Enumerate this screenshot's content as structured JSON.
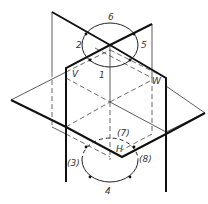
{
  "diagram": {
    "type": "three intersecting planes with rotation circles",
    "planes": {
      "V": "V",
      "W": "W",
      "H": "H"
    },
    "top_circle_labels": {
      "l1": "1",
      "l2": "2",
      "l5": "5",
      "l6": "6"
    },
    "bottom_circle_labels": {
      "l3": "(3)",
      "l4": "4",
      "l7": "(7)",
      "l8": "(8)"
    }
  }
}
